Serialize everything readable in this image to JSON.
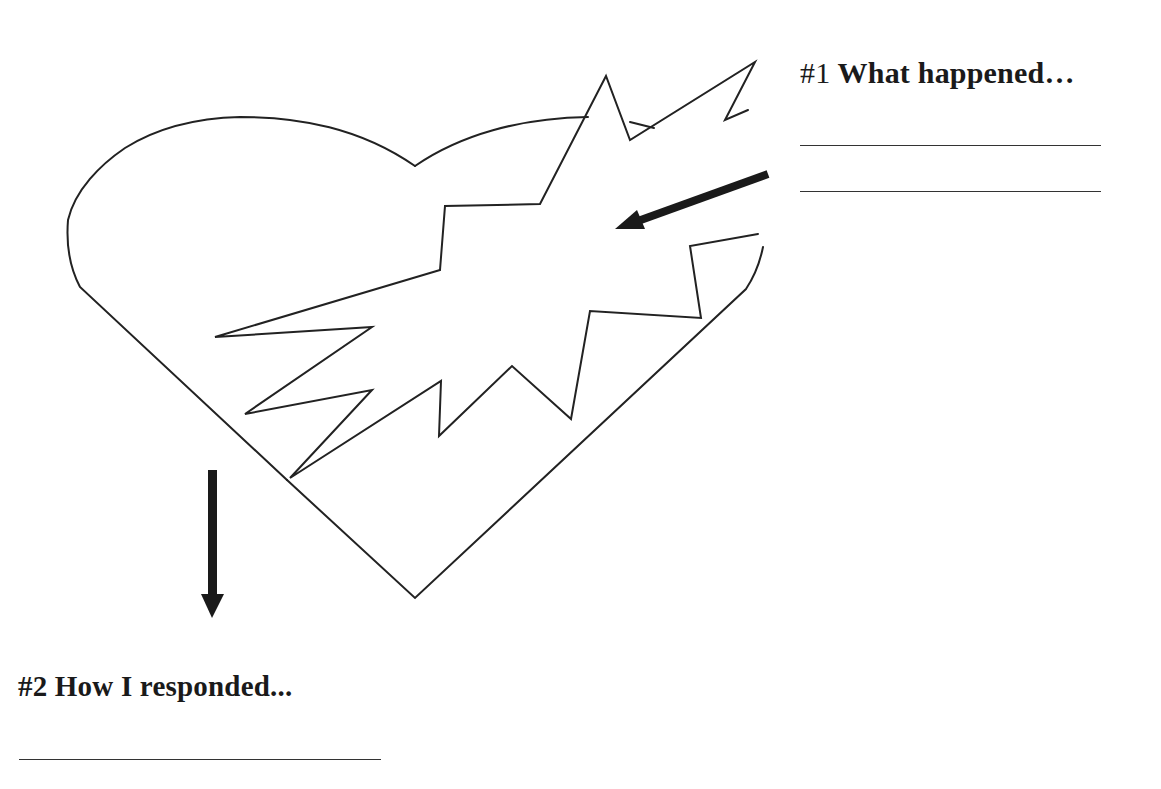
{
  "worksheet": {
    "prompts": [
      {
        "id": 1,
        "number_label": "#1",
        "text": "What happened…",
        "answer_lines": 2
      },
      {
        "id": 2,
        "number_label": "#2",
        "text": "How I responded...",
        "answer_lines": 1
      }
    ],
    "illustration": {
      "subject": "broken-heart",
      "icons": [
        "heart-outline",
        "crack-jagged-shape",
        "arrow-pointing-into-crack",
        "arrow-pointing-down"
      ]
    },
    "colors": {
      "background": "#ffffff",
      "ink": "#1a1a1a",
      "line": "#333333"
    }
  }
}
